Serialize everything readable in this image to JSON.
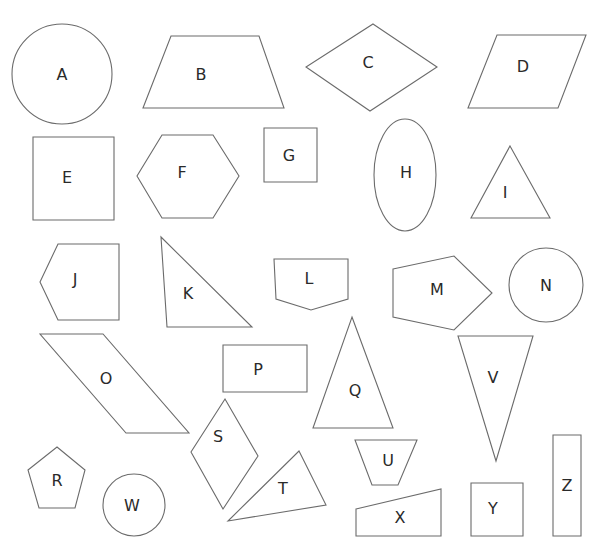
{
  "canvas": {
    "width": 607,
    "height": 558,
    "background": "#ffffff",
    "stroke": "#6b6b6b",
    "label_color": "#2a2a2a"
  },
  "shapes": [
    {
      "id": "A",
      "type": "circle",
      "name": "circle",
      "cx": 62,
      "cy": 74,
      "r": 50,
      "label_x": 62,
      "label_y": 74
    },
    {
      "id": "B",
      "type": "polygon",
      "name": "trapezoid",
      "points": [
        [
          171,
          36
        ],
        [
          259,
          36
        ],
        [
          284,
          108
        ],
        [
          143,
          108
        ]
      ],
      "label_x": 201,
      "label_y": 74
    },
    {
      "id": "C",
      "type": "polygon",
      "name": "rhombus",
      "points": [
        [
          373,
          24
        ],
        [
          437,
          67
        ],
        [
          370,
          111
        ],
        [
          306,
          67
        ]
      ],
      "label_x": 368,
      "label_y": 62
    },
    {
      "id": "D",
      "type": "polygon",
      "name": "parallelogram",
      "points": [
        [
          497,
          35
        ],
        [
          586,
          35
        ],
        [
          558,
          108
        ],
        [
          468,
          108
        ]
      ],
      "label_x": 523,
      "label_y": 66
    },
    {
      "id": "E",
      "type": "polygon",
      "name": "square",
      "points": [
        [
          33,
          137
        ],
        [
          114,
          137
        ],
        [
          114,
          220
        ],
        [
          33,
          220
        ]
      ],
      "label_x": 67,
      "label_y": 177
    },
    {
      "id": "F",
      "type": "polygon",
      "name": "hexagon",
      "points": [
        [
          162,
          135
        ],
        [
          213,
          135
        ],
        [
          239,
          176
        ],
        [
          213,
          218
        ],
        [
          162,
          218
        ],
        [
          137,
          176
        ]
      ],
      "label_x": 182,
      "label_y": 172
    },
    {
      "id": "G",
      "type": "polygon",
      "name": "square",
      "points": [
        [
          264,
          128
        ],
        [
          317,
          128
        ],
        [
          317,
          182
        ],
        [
          264,
          182
        ]
      ],
      "label_x": 289,
      "label_y": 155
    },
    {
      "id": "H",
      "type": "ellipse",
      "name": "ellipse",
      "cx": 405,
      "cy": 175,
      "rx": 31,
      "ry": 56,
      "label_x": 406,
      "label_y": 172
    },
    {
      "id": "I",
      "type": "polygon",
      "name": "triangle",
      "points": [
        [
          510,
          146
        ],
        [
          550,
          218
        ],
        [
          471,
          218
        ]
      ],
      "label_x": 505,
      "label_y": 192
    },
    {
      "id": "J",
      "type": "polygon",
      "name": "pentagon",
      "points": [
        [
          58,
          244
        ],
        [
          119,
          244
        ],
        [
          119,
          320
        ],
        [
          58,
          320
        ],
        [
          40,
          282
        ]
      ],
      "label_x": 75,
      "label_y": 279
    },
    {
      "id": "K",
      "type": "polygon",
      "name": "right-triangle",
      "points": [
        [
          161,
          237
        ],
        [
          252,
          327
        ],
        [
          167,
          327
        ]
      ],
      "label_x": 188,
      "label_y": 293
    },
    {
      "id": "L",
      "type": "polygon",
      "name": "pentagon",
      "points": [
        [
          274,
          259
        ],
        [
          348,
          259
        ],
        [
          348,
          299
        ],
        [
          311,
          310
        ],
        [
          276,
          299
        ]
      ],
      "label_x": 309,
      "label_y": 278
    },
    {
      "id": "M",
      "type": "polygon",
      "name": "pentagon",
      "points": [
        [
          393,
          269
        ],
        [
          454,
          256
        ],
        [
          492,
          293
        ],
        [
          454,
          330
        ],
        [
          393,
          317
        ]
      ],
      "label_x": 437,
      "label_y": 289
    },
    {
      "id": "N",
      "type": "circle",
      "name": "circle",
      "cx": 546,
      "cy": 285,
      "r": 37,
      "label_x": 546,
      "label_y": 285
    },
    {
      "id": "O",
      "type": "polygon",
      "name": "parallelogram",
      "points": [
        [
          40,
          334
        ],
        [
          103,
          334
        ],
        [
          189,
          433
        ],
        [
          126,
          433
        ]
      ],
      "label_x": 106,
      "label_y": 378
    },
    {
      "id": "P",
      "type": "polygon",
      "name": "rectangle",
      "points": [
        [
          223,
          345
        ],
        [
          307,
          345
        ],
        [
          307,
          392
        ],
        [
          223,
          392
        ]
      ],
      "label_x": 258,
      "label_y": 369
    },
    {
      "id": "Q",
      "type": "polygon",
      "name": "triangle",
      "points": [
        [
          352,
          317
        ],
        [
          393,
          428
        ],
        [
          313,
          428
        ]
      ],
      "label_x": 355,
      "label_y": 390
    },
    {
      "id": "R",
      "type": "polygon",
      "name": "pentagon",
      "points": [
        [
          57,
          447
        ],
        [
          85,
          470
        ],
        [
          75,
          508
        ],
        [
          39,
          508
        ],
        [
          28,
          470
        ]
      ],
      "label_x": 57,
      "label_y": 480
    },
    {
      "id": "S",
      "type": "polygon",
      "name": "rhombus",
      "points": [
        [
          225,
          399
        ],
        [
          258,
          456
        ],
        [
          223,
          509
        ],
        [
          191,
          452
        ]
      ],
      "label_x": 218,
      "label_y": 436
    },
    {
      "id": "T",
      "type": "polygon",
      "name": "triangle",
      "points": [
        [
          299,
          451
        ],
        [
          326,
          505
        ],
        [
          228,
          521
        ]
      ],
      "label_x": 283,
      "label_y": 488
    },
    {
      "id": "U",
      "type": "polygon",
      "name": "trapezoid",
      "points": [
        [
          355,
          440
        ],
        [
          417,
          440
        ],
        [
          398,
          485
        ],
        [
          372,
          485
        ]
      ],
      "label_x": 388,
      "label_y": 460
    },
    {
      "id": "V",
      "type": "polygon",
      "name": "inverted-triangle",
      "points": [
        [
          458,
          336
        ],
        [
          533,
          336
        ],
        [
          496,
          461
        ]
      ],
      "label_x": 493,
      "label_y": 377
    },
    {
      "id": "W",
      "type": "circle",
      "name": "circle",
      "cx": 134,
      "cy": 505,
      "r": 31,
      "label_x": 132,
      "label_y": 505
    },
    {
      "id": "X",
      "type": "polygon",
      "name": "right-trapezoid",
      "points": [
        [
          356,
          509
        ],
        [
          441,
          489
        ],
        [
          441,
          536
        ],
        [
          356,
          536
        ]
      ],
      "label_x": 400,
      "label_y": 517
    },
    {
      "id": "Y",
      "type": "polygon",
      "name": "square",
      "points": [
        [
          471,
          483
        ],
        [
          523,
          483
        ],
        [
          523,
          536
        ],
        [
          471,
          536
        ]
      ],
      "label_x": 493,
      "label_y": 508
    },
    {
      "id": "Z",
      "type": "polygon",
      "name": "rectangle",
      "points": [
        [
          553,
          435
        ],
        [
          581,
          435
        ],
        [
          581,
          536
        ],
        [
          553,
          536
        ]
      ],
      "label_x": 567,
      "label_y": 485
    }
  ]
}
